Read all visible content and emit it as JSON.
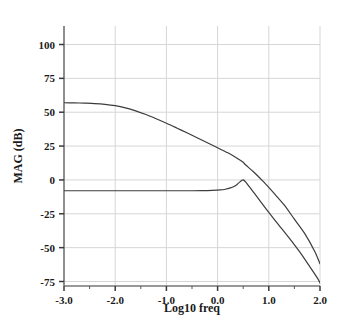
{
  "chart_data": {
    "type": "line",
    "title": "",
    "xlabel": "Log10 freq",
    "ylabel": "MAG (dB)",
    "xlim": [
      -3.0,
      2.0
    ],
    "ylim": [
      -87,
      112
    ],
    "grid": true,
    "legend_position": "none",
    "xticks": [
      -3.0,
      -2.0,
      -1.0,
      0.0,
      1.0,
      2.0
    ],
    "xtick_labels": [
      "-3.0",
      "-2.0",
      "-1.0",
      "0.0",
      "1.0",
      "2.0"
    ],
    "yticks": [
      100,
      75,
      50,
      25,
      0,
      -25,
      -50,
      -75
    ],
    "ytick_labels": [
      "100",
      "75",
      "50",
      "25",
      "0",
      "-25",
      "-50",
      "-75"
    ],
    "x_minor_ticks": [
      -2.5,
      -1.5,
      -0.5,
      0.5,
      1.5
    ],
    "series": [
      {
        "name": "open-loop gain",
        "color": "#3c3c3c",
        "points": [
          [
            -3.0,
            57.0
          ],
          [
            -2.8,
            56.9
          ],
          [
            -2.6,
            56.7
          ],
          [
            -2.4,
            56.4
          ],
          [
            -2.2,
            55.8
          ],
          [
            -2.0,
            54.8
          ],
          [
            -1.8,
            53.2
          ],
          [
            -1.6,
            51.0
          ],
          [
            -1.4,
            48.3
          ],
          [
            -1.2,
            45.2
          ],
          [
            -1.0,
            41.9
          ],
          [
            -0.8,
            38.4
          ],
          [
            -0.6,
            34.8
          ],
          [
            -0.4,
            31.2
          ],
          [
            -0.2,
            27.5
          ],
          [
            0.0,
            23.8
          ],
          [
            0.2,
            20.0
          ],
          [
            0.35,
            16.8
          ],
          [
            0.45,
            14.4
          ],
          [
            0.5,
            13.0
          ],
          [
            0.55,
            11.0
          ],
          [
            0.7,
            6.0
          ],
          [
            0.9,
            -1.5
          ],
          [
            1.1,
            -9.8
          ],
          [
            1.3,
            -18.5
          ],
          [
            1.5,
            -29.0
          ],
          [
            1.7,
            -39.5
          ],
          [
            1.9,
            -53.0
          ],
          [
            2.0,
            -62.0
          ]
        ]
      },
      {
        "name": "closed-loop gain",
        "color": "#3c3c3c",
        "points": [
          [
            -3.0,
            -8.0
          ],
          [
            -2.5,
            -8.0
          ],
          [
            -2.0,
            -8.0
          ],
          [
            -1.5,
            -8.0
          ],
          [
            -1.0,
            -8.0
          ],
          [
            -0.6,
            -8.0
          ],
          [
            -0.3,
            -7.9
          ],
          [
            -0.1,
            -7.7
          ],
          [
            0.05,
            -7.4
          ],
          [
            0.15,
            -6.9
          ],
          [
            0.25,
            -5.9
          ],
          [
            0.32,
            -4.8
          ],
          [
            0.38,
            -3.3
          ],
          [
            0.43,
            -1.6
          ],
          [
            0.47,
            -0.5
          ],
          [
            0.5,
            0.0
          ],
          [
            0.55,
            -1.6
          ],
          [
            0.62,
            -5.0
          ],
          [
            0.72,
            -10.0
          ],
          [
            0.85,
            -16.5
          ],
          [
            1.0,
            -24.0
          ],
          [
            1.2,
            -33.5
          ],
          [
            1.4,
            -43.0
          ],
          [
            1.6,
            -53.0
          ],
          [
            1.8,
            -64.0
          ],
          [
            1.95,
            -72.5
          ],
          [
            2.0,
            -76.0
          ]
        ]
      }
    ]
  },
  "axes": {
    "x_title": "Log10 freq",
    "y_title": "MAG (dB)"
  }
}
